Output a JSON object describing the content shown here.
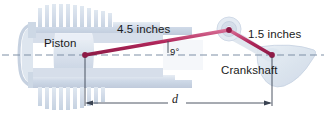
{
  "figure": {
    "labels": {
      "rod_length": "4.5 inches",
      "crank_length": "1.5 inches",
      "piston": "Piston",
      "crankshaft": "Crankshaft",
      "angle": "9°",
      "distance": "d"
    },
    "colors": {
      "linkage": "#b0265a",
      "linkage_highlight": "#d86f96",
      "centerline": "#7e8fa6",
      "dimension": "#3a4352",
      "engine_body": "#ced8e6",
      "engine_body_light": "#dde5ef",
      "engine_body_dark": "#bcc8da",
      "text": "#1a1a1a"
    },
    "geometry": {
      "piston_pin": [
        85,
        55
      ],
      "crank_pin": [
        229,
        30
      ],
      "crank_center": [
        272,
        55
      ],
      "centerline_y": 55,
      "dimension_y": 103,
      "dimension_left_x": 85,
      "dimension_right_x": 272
    }
  }
}
